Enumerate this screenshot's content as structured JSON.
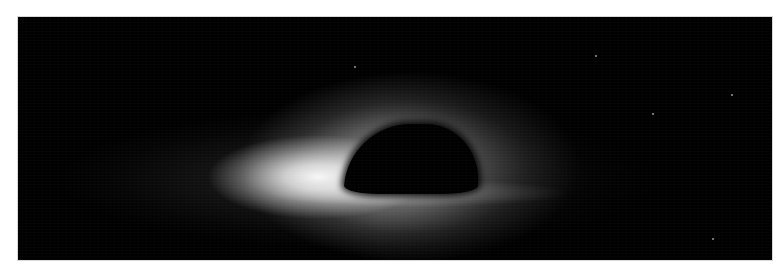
{
  "image": {
    "subject": "black-hole-simulation",
    "background_color": "#ffffff",
    "frame_color": "#000000",
    "glow_color": "#ffffff"
  },
  "stars": [
    {
      "x": 336,
      "y": 49
    },
    {
      "x": 577,
      "y": 38
    },
    {
      "x": 634,
      "y": 96
    },
    {
      "x": 713,
      "y": 77
    },
    {
      "x": 694,
      "y": 221
    }
  ]
}
